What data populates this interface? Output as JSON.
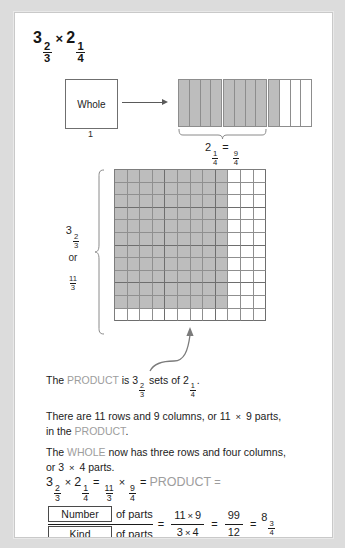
{
  "title": {
    "a_whole": "3",
    "a_num": "2",
    "a_den": "3",
    "times": "×",
    "b_whole": "2",
    "b_num": "1",
    "b_den": "4"
  },
  "whole_box": {
    "label": "Whole",
    "value": "1"
  },
  "strips": {
    "caption_whole": "2",
    "caption_num": "1",
    "caption_den": "4",
    "caption_eq": "=",
    "caption_rnum": "9",
    "caption_rden": "4",
    "groups": [
      {
        "shaded": [
          true,
          true,
          true,
          true
        ]
      },
      {
        "shaded": [
          true,
          true,
          true,
          true
        ]
      },
      {
        "shaded": [
          true,
          false,
          false,
          false
        ]
      }
    ]
  },
  "left_label": {
    "whole": "3",
    "num": "2",
    "den": "3",
    "or": "or",
    "inum": "11",
    "iden": "3"
  },
  "grid": {
    "rows": 12,
    "cols": 12,
    "shaded_rows": 11,
    "shaded_cols": 9,
    "group_rows": 3,
    "group_cols": 4,
    "cell_size": 12.6
  },
  "paragraphs": {
    "p1_a": "The ",
    "p1_product": "PRODUCT",
    "p1_b": " is ",
    "p1_w1": "3",
    "p1_n1": "2",
    "p1_d1": "3",
    "p1_c": " sets of ",
    "p1_w2": "2",
    "p1_n2": "1",
    "p1_d2": "4",
    "p1_end": ".",
    "p2_a": "There are 11 rows and 9 columns, or 11 ",
    "p2_mul": "×",
    "p2_b": " 9 parts,",
    "p2_c": "in the ",
    "p2_product": "PRODUCT",
    "p2_end": ".",
    "p3_a": "The ",
    "p3_whole": "WHOLE",
    "p3_b": " now has three rows and four columns,",
    "p3_c": "or 3 ",
    "p3_mul": "×",
    "p3_d": " 4 parts."
  },
  "equation": {
    "w1": "3",
    "n1": "2",
    "d1": "3",
    "times": "×",
    "w2": "2",
    "n2": "1",
    "d2": "4",
    "eq1": "=",
    "f1n": "11",
    "f1d": "3",
    "times2": "×",
    "f2n": "9",
    "f2d": "4",
    "eq2": "=",
    "product": "PRODUCT",
    "eq3": "="
  },
  "number_kind": {
    "number_box": "Number",
    "kind_box": "Kind",
    "of_parts_top": "of parts",
    "of_parts_bottom": "of parts",
    "eq1": "=",
    "num_left": "11",
    "num_mul": "×",
    "num_right": "9",
    "den_left": "3",
    "den_mul": "×",
    "den_right": "4",
    "eq2": "=",
    "res_num": "99",
    "res_den": "12",
    "eq3": "=",
    "final_whole": "8",
    "final_num": "3",
    "final_den": "4"
  },
  "colors": {
    "shade": "#bdbdbd",
    "gridline": "#8f8f8f",
    "thickline": "#6e6e6e",
    "gray_text": "#9d9d9d",
    "card_bg": "#ffffff",
    "page_bg": "#dcdcdc"
  }
}
